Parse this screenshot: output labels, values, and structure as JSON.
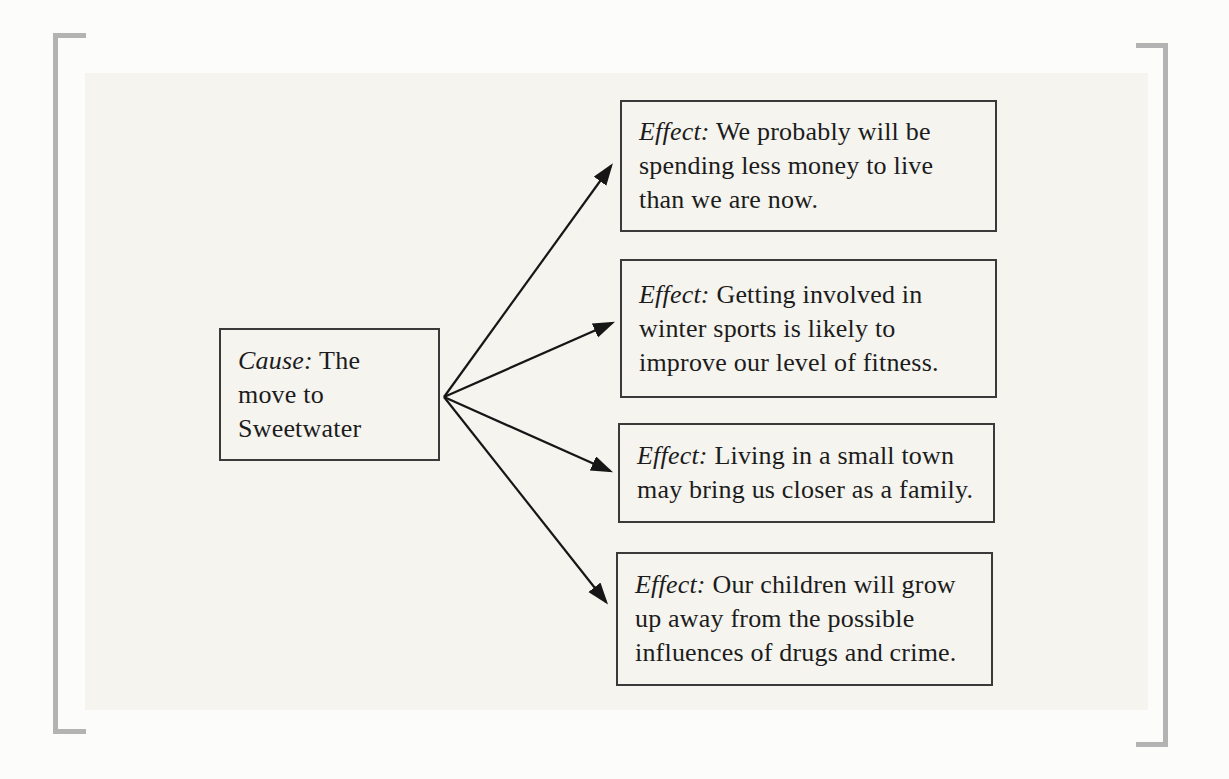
{
  "diagram": {
    "cause": {
      "prefix": "Cause:",
      "text": "The move to Sweetwater"
    },
    "effects": [
      {
        "prefix": "Effect:",
        "text": "We probably will be spending less money to live than we are now."
      },
      {
        "prefix": "Effect:",
        "text": "Getting involved in winter sports is likely to improve our level of fitness."
      },
      {
        "prefix": "Effect:",
        "text": "Living in a small town may bring us closer as a family."
      },
      {
        "prefix": "Effect:",
        "text": "Our children will grow up away from the possible influences of drugs and crime."
      }
    ],
    "colors": {
      "page_bg": "#fcfcfb",
      "panel_bg": "#f5f4ef",
      "bracket": "#b3b3b3",
      "box_border": "#3a3a3a",
      "line": "#161616",
      "text": "#1c1c1c"
    }
  }
}
